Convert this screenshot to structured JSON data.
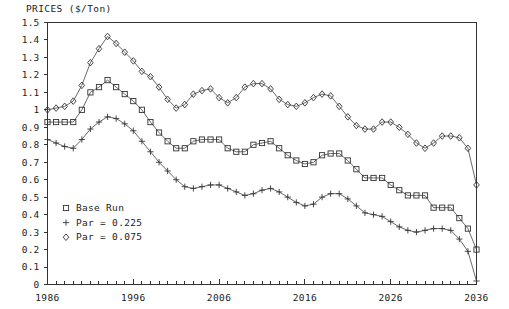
{
  "chart_data": {
    "type": "line",
    "title": "PRICES ($/Ton)",
    "xlabel": "",
    "ylabel": "PRICES ($/Ton)",
    "xlim": [
      1986,
      2036
    ],
    "ylim": [
      0,
      1.5
    ],
    "grid": false,
    "legend_position": "inside-lower-left",
    "x_tick_labels": [
      "1986",
      "1996",
      "2006",
      "2016",
      "2026",
      "2036"
    ],
    "x_major_ticks": [
      1986,
      1996,
      2006,
      2016,
      2026,
      2036
    ],
    "x_minor_tick_step": 1,
    "y_tick_labels": [
      "0",
      "0.1",
      "0.2",
      "0.3",
      "0.4",
      "0.5",
      "0.6",
      "0.7",
      "0.8",
      "0.9",
      "1",
      "1.1",
      "1.2",
      "1.3",
      "1.4",
      "1.5"
    ],
    "y_ticks": [
      0,
      0.1,
      0.2,
      0.3,
      0.4,
      0.5,
      0.6,
      0.7,
      0.8,
      0.9,
      1.0,
      1.1,
      1.2,
      1.3,
      1.4,
      1.5
    ],
    "x": [
      1986,
      1987,
      1988,
      1989,
      1990,
      1991,
      1992,
      1993,
      1994,
      1995,
      1996,
      1997,
      1998,
      1999,
      2000,
      2001,
      2002,
      2003,
      2004,
      2005,
      2006,
      2007,
      2008,
      2009,
      2010,
      2011,
      2012,
      2013,
      2014,
      2015,
      2016,
      2017,
      2018,
      2019,
      2020,
      2021,
      2022,
      2023,
      2024,
      2025,
      2026,
      2027,
      2028,
      2029,
      2030,
      2031,
      2032,
      2033,
      2034,
      2035,
      2036
    ],
    "series": [
      {
        "name": "Base Run",
        "marker": "square",
        "values": [
          0.93,
          0.93,
          0.93,
          0.93,
          1.0,
          1.1,
          1.13,
          1.17,
          1.13,
          1.09,
          1.05,
          1.0,
          0.93,
          0.87,
          0.82,
          0.78,
          0.78,
          0.82,
          0.83,
          0.83,
          0.83,
          0.78,
          0.76,
          0.76,
          0.8,
          0.81,
          0.82,
          0.78,
          0.74,
          0.71,
          0.69,
          0.7,
          0.74,
          0.75,
          0.75,
          0.71,
          0.66,
          0.61,
          0.61,
          0.61,
          0.57,
          0.54,
          0.51,
          0.51,
          0.51,
          0.44,
          0.44,
          0.44,
          0.38,
          0.32,
          0.2
        ]
      },
      {
        "name": "Par = 0.225",
        "marker": "plus",
        "values": [
          0.83,
          0.81,
          0.79,
          0.78,
          0.83,
          0.89,
          0.93,
          0.96,
          0.95,
          0.92,
          0.88,
          0.82,
          0.76,
          0.7,
          0.65,
          0.6,
          0.56,
          0.55,
          0.56,
          0.57,
          0.57,
          0.55,
          0.53,
          0.51,
          0.52,
          0.54,
          0.55,
          0.53,
          0.5,
          0.47,
          0.45,
          0.46,
          0.5,
          0.52,
          0.52,
          0.49,
          0.45,
          0.41,
          0.4,
          0.39,
          0.36,
          0.33,
          0.31,
          0.3,
          0.31,
          0.32,
          0.32,
          0.31,
          0.26,
          0.19,
          0.02
        ]
      },
      {
        "name": "Par = 0.075",
        "marker": "diamond",
        "values": [
          1.0,
          1.01,
          1.02,
          1.05,
          1.14,
          1.27,
          1.35,
          1.42,
          1.38,
          1.33,
          1.28,
          1.22,
          1.19,
          1.13,
          1.06,
          1.01,
          1.03,
          1.09,
          1.11,
          1.12,
          1.07,
          1.04,
          1.07,
          1.13,
          1.15,
          1.15,
          1.12,
          1.06,
          1.03,
          1.02,
          1.04,
          1.07,
          1.09,
          1.08,
          1.02,
          0.96,
          0.91,
          0.89,
          0.89,
          0.93,
          0.93,
          0.9,
          0.86,
          0.81,
          0.78,
          0.81,
          0.85,
          0.85,
          0.84,
          0.78,
          0.57
        ]
      }
    ]
  },
  "legend": {
    "items": [
      {
        "label": "Base Run",
        "marker": "square"
      },
      {
        "label": "Par = 0.225",
        "marker": "plus"
      },
      {
        "label": "Par = 0.075",
        "marker": "diamond"
      }
    ]
  }
}
